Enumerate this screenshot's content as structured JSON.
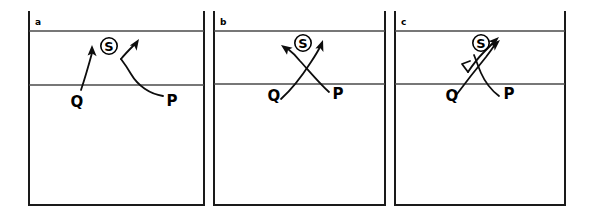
{
  "figure": {
    "title": "",
    "background_color": "#ffffff",
    "ink_color": "#000000",
    "width": 592,
    "height": 217,
    "panel_count": 3
  },
  "panels": [
    {
      "letter": "a",
      "letter_name": "panel-label-a",
      "labels": {
        "source": "S",
        "left_vertex": "Q",
        "right_vertex": "P"
      },
      "description": "Two upward arrows rising toward circled S; the Q arrow is straight, the P arrow bends with a long curved tail running right to P."
    },
    {
      "letter": "b",
      "letter_name": "panel-label-b",
      "labels": {
        "source": "S",
        "left_vertex": "Q",
        "right_vertex": "P"
      },
      "description": "Two crossing curved arrows forming an X below the circled S; one points up-right, the other points up-left."
    },
    {
      "letter": "c",
      "letter_name": "panel-label-c",
      "labels": {
        "source": "S",
        "left_vertex": "Q",
        "right_vertex": "P"
      },
      "description": "Two nearly parallel arrows aimed up-right past the circled S, crossing a short curved tail down to P."
    }
  ],
  "symbols": {
    "circled_s": "S",
    "q_label": "Q",
    "p_label": "P"
  }
}
